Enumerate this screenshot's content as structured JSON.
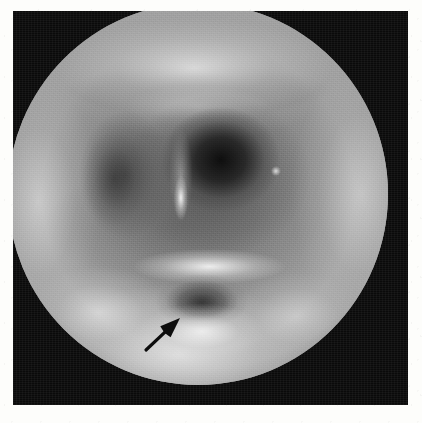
{
  "figure": {
    "domain": "medical-endoscopic-photograph",
    "modality": "endoscopy",
    "color_mode": "grayscale",
    "page_background": "#fdfdfb",
    "frame_background": "#0a0a0a",
    "field_of_view_shape": "circle",
    "caption": "",
    "title": "",
    "labels": []
  },
  "frame": {
    "x": 13,
    "y": 11,
    "width": 395,
    "height": 394
  },
  "field_of_view": {
    "center_x": 198,
    "center_y": 194,
    "radius_x": 190,
    "radius_y": 191,
    "base_tone": "#8c8c8c",
    "rim_tone": "#0a0a0a"
  },
  "regions": [
    {
      "name": "upper-mucosal-arch",
      "description": "bright arched mucosal ridge across the top of the field",
      "tone": "bright",
      "center_pct": [
        49,
        17
      ]
    },
    {
      "name": "left-lateral-wall",
      "description": "bright lateral mucosal wall on the left",
      "tone": "bright",
      "center_pct": [
        8,
        52
      ]
    },
    {
      "name": "right-lateral-wall",
      "description": "bright lateral mucosal wall on the right",
      "tone": "bright",
      "center_pct": [
        93,
        50
      ]
    },
    {
      "name": "central-airway-cavity",
      "description": "dark central lumen just right of midline",
      "tone": "very-dark",
      "center_pct": [
        56,
        41
      ]
    },
    {
      "name": "left-cavity",
      "description": "dark recess on the left of midline",
      "tone": "dark",
      "center_pct": [
        31,
        45
      ]
    },
    {
      "name": "midline-highlight",
      "description": "bright vertical specular streak on the midline fold",
      "tone": "specular",
      "center_pct": [
        45,
        51
      ]
    },
    {
      "name": "lower-bright-ridge",
      "description": "bright transverse ridge immediately above the lesion",
      "tone": "bright",
      "center_pct": [
        53,
        69
      ]
    },
    {
      "name": "lesion",
      "description": "dark oval depression indicated by the arrow",
      "tone": "dark",
      "center_pct": [
        51,
        78
      ]
    },
    {
      "name": "inferior-floor",
      "description": "broad bright mucosal floor at the bottom of the field",
      "tone": "bright",
      "center_pct": [
        45,
        92
      ]
    }
  ],
  "annotation": {
    "type": "arrow",
    "color": "#0d0d0d",
    "points_to": "lesion",
    "tail_x": 146,
    "tail_y": 350,
    "tip_x": 180,
    "tip_y": 318,
    "shaft_width": 3.2,
    "head_length": 20,
    "head_width": 15
  }
}
